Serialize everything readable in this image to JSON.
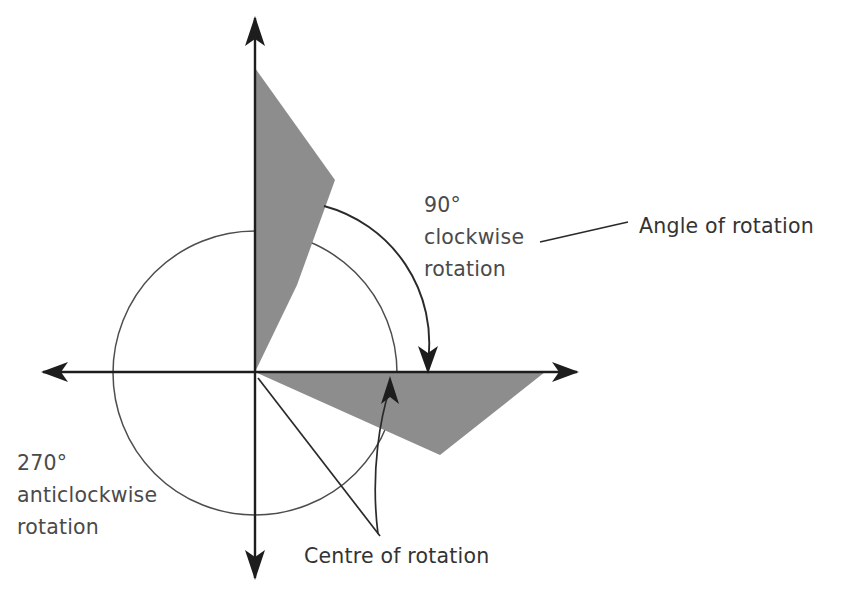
{
  "diagram": {
    "background_color": "#ffffff",
    "shape_fill_color": "#8d8d8d",
    "axis_color": "#1d1d1d",
    "guide_circle_color": "#4d4d4d",
    "text_color": "#4a4a4a",
    "origin": {
      "x": 255,
      "y": 372
    },
    "guide_circle": {
      "cx": 255,
      "cy": 373,
      "r": 142
    },
    "axes": {
      "x_axis": {
        "x1": 43,
        "y1": 372,
        "x2": 577,
        "y2": 372,
        "arrows": [
          "left",
          "right"
        ]
      },
      "y_axis": {
        "x1": 255,
        "y1": 18,
        "x2": 255,
        "y2": 578,
        "arrows": [
          "up",
          "down"
        ]
      }
    },
    "shapes": [
      {
        "name": "original-shape",
        "points": "255,68 335,180 297,285 255,372",
        "fill": "#8d8d8d"
      },
      {
        "name": "rotated-shape",
        "points": "255,372 545,372 440,455",
        "fill": "#8d8d8d"
      }
    ],
    "rotation_arc": {
      "name": "clockwise-rotation-arc",
      "path": "M 324,206 A 142,142 0 0 1 428,362",
      "arrow_at": {
        "x": 428,
        "y": 372
      },
      "direction": "clockwise"
    },
    "centre_pointer": {
      "name": "centre-of-rotation-pointer",
      "path": "M 378,534 C 370,470 381,415 390,388",
      "arrow_at": {
        "x": 390,
        "y": 378
      }
    },
    "leader_lines": [
      {
        "name": "angle-of-rotation-leader",
        "x1": 540,
        "y1": 242,
        "x2": 628,
        "y2": 222
      },
      {
        "name": "centre-of-rotation-leader",
        "x1": 258,
        "y1": 378,
        "x2": 380,
        "y2": 536
      }
    ],
    "labels": [
      {
        "name": "clockwise-rotation-label",
        "lines": [
          "90°",
          "clockwise",
          "rotation"
        ],
        "x": 424,
        "y": 212
      },
      {
        "name": "angle-of-rotation-label",
        "lines": [
          "Angle of rotation"
        ],
        "x": 639,
        "y": 233
      },
      {
        "name": "anticlockwise-rotation-label",
        "lines": [
          "270°",
          "anticlockwise",
          "rotation"
        ],
        "x": 17,
        "y": 470
      },
      {
        "name": "centre-of-rotation-label",
        "lines": [
          "Centre of rotation"
        ],
        "x": 304,
        "y": 563
      }
    ]
  },
  "chart_data": {
    "type": "diagram",
    "annotations": [
      "90° clockwise rotation",
      "Angle of rotation",
      "270° anticlockwise rotation",
      "Centre of rotation"
    ],
    "centre_of_rotation": [
      255,
      372
    ],
    "angle_degrees_clockwise": 90,
    "angle_degrees_anticlockwise": 270
  }
}
